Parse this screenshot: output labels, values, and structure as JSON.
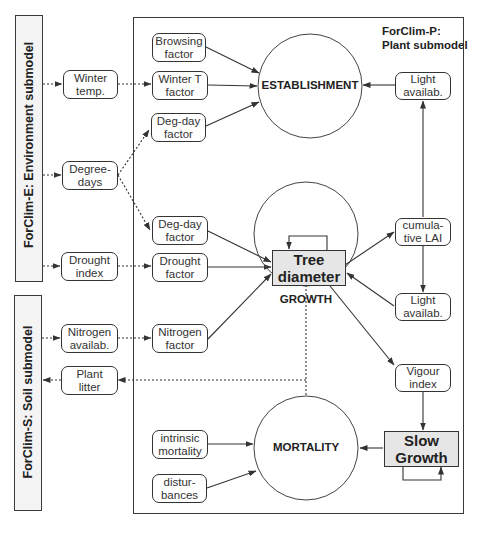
{
  "panels": {
    "environment": {
      "label": "ForClim-E: Environment submodel"
    },
    "soil": {
      "label": "ForClim-S: Soil submodel"
    },
    "plant": {
      "title": "ForClim-P:\nPlant submodel"
    }
  },
  "environment_outputs": {
    "winter_temp": "Winter\ntemp.",
    "degree_days": "Degree-\ndays",
    "drought_index": "Drought\nindex"
  },
  "soil_io": {
    "nitrogen_availab": "Nitrogen\navailab.",
    "plant_litter": "Plant\nlitter"
  },
  "factors": {
    "browsing": "Browsing\nfactor",
    "winter_t": "Winter T\nfactor",
    "deg_day_establishment": "Deg-day\nfactor",
    "deg_day_growth": "Deg-day\nfactor",
    "drought": "Drought\nfactor",
    "nitrogen": "Nitrogen\nfactor",
    "intrinsic_mortality": "intrinsic\nmortality",
    "disturbances": "distur-\nbances"
  },
  "right_nodes": {
    "light_availab_top": "Light\navailab.",
    "cumulative_lai": "cumula-\ntive LAI",
    "light_availab_bottom": "Light\navailab.",
    "vigour_index": "Vigour\nindex"
  },
  "processes": {
    "establishment": "ESTABLISHMENT",
    "growth": "GROWTH",
    "mortality": "MORTALITY"
  },
  "states": {
    "tree_diameter": "Tree\ndiameter",
    "slow_growth": "Slow\nGrowth"
  },
  "colors": {
    "line": "#333333",
    "state_fill": "#e6e6e6",
    "panel_fill": "#f4f4f4"
  }
}
